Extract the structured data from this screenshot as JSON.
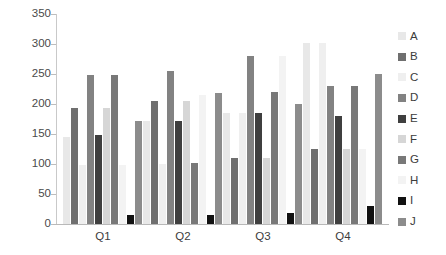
{
  "chart_data": {
    "type": "bar",
    "title": "",
    "subtitle": "",
    "xlabel": "",
    "ylabel": "",
    "categories": [
      "Q1",
      "Q2",
      "Q3",
      "Q4"
    ],
    "ylim": [
      0,
      350
    ],
    "yticks": [
      0,
      50,
      100,
      150,
      200,
      250,
      300,
      350
    ],
    "ytick_labels": [
      "0",
      "50",
      "100",
      "150",
      "200",
      "250",
      "300",
      "350"
    ],
    "grid": false,
    "legend_position": "right",
    "legend_entries": [
      "A",
      "B",
      "C",
      "D",
      "E",
      "F",
      "G",
      "H",
      "I",
      "J"
    ],
    "series": [
      {
        "name": "A",
        "color": "#e8e8e8",
        "values": [
          145,
          172,
          185,
          302
        ]
      },
      {
        "name": "B",
        "color": "#6f6f6f",
        "values": [
          193,
          205,
          110,
          125
        ]
      },
      {
        "name": "C",
        "color": "#efefef",
        "values": [
          98,
          100,
          185,
          302
        ]
      },
      {
        "name": "D",
        "color": "#828282",
        "values": [
          248,
          255,
          280,
          230
        ]
      },
      {
        "name": "E",
        "color": "#3f3f3f",
        "values": [
          148,
          172,
          185,
          180
        ]
      },
      {
        "name": "F",
        "color": "#d6d6d6",
        "values": [
          193,
          205,
          110,
          125
        ]
      },
      {
        "name": "G",
        "color": "#787878",
        "values": [
          248,
          102,
          220,
          230
        ]
      },
      {
        "name": "H",
        "color": "#f3f3f3",
        "values": [
          99,
          215,
          280,
          125
        ]
      },
      {
        "name": "I",
        "color": "#111111",
        "values": [
          15,
          15,
          18,
          30
        ]
      },
      {
        "name": "J",
        "color": "#8c8c8c",
        "values": [
          172,
          218,
          200,
          250
        ]
      }
    ]
  },
  "axes": {
    "y_max": 350,
    "plot_height_px": 210
  }
}
